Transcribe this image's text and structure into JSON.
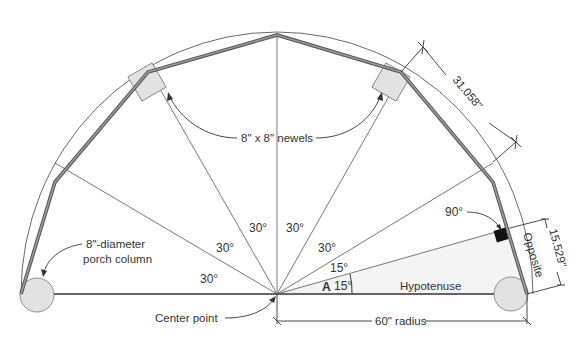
{
  "diagram": {
    "labels": {
      "newels": "8\" x 8\" newels",
      "porch_column_line1": "8\"-diameter",
      "porch_column_line2": "porch column",
      "center_point": "Center point",
      "radius": "60\" radius",
      "hypotenuse": "Hypotenuse",
      "opposite": "Opposite",
      "side_length": "31.058\"",
      "opposite_length": "15.529\"",
      "right_angle": "90°",
      "angle_marker": "A"
    },
    "angles": {
      "sector_1": "30°",
      "sector_2": "30°",
      "sector_3": "30°",
      "sector_4": "30°",
      "sector_5": "30°",
      "half_upper": "15°",
      "half_lower": "15°"
    },
    "measurements": {
      "radius_in": 60,
      "side_in": 31.058,
      "opposite_in": 15.529,
      "sector_angle_deg": 30,
      "half_angle_deg": 15,
      "column_diameter_in": 8,
      "newel_size_in": "8 x 8"
    },
    "colors": {
      "line": "#333333",
      "rail_fill": "#8a8a8a",
      "shape_fill": "#e2e2e2",
      "triangle_fill": "#f3f3f3",
      "right_angle_mark": "#111111"
    }
  }
}
